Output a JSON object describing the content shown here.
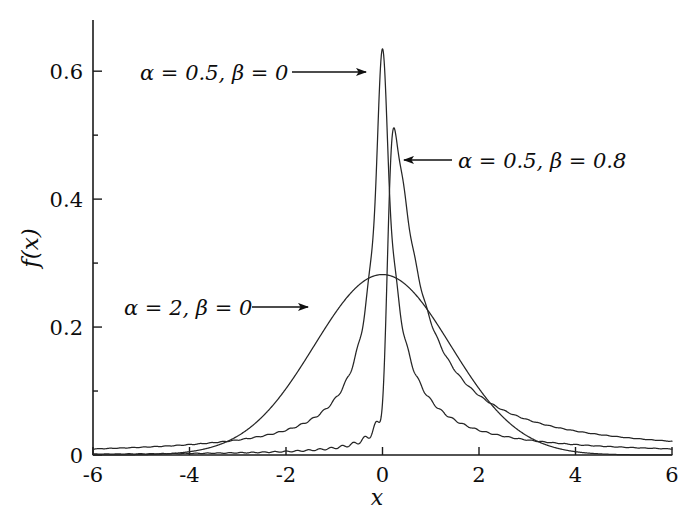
{
  "chart_data": {
    "type": "line",
    "title": "",
    "xlabel": "x",
    "ylabel": "f(x)",
    "xlim": [
      -6,
      6
    ],
    "ylim": [
      0,
      0.68
    ],
    "grid": false,
    "legend_position": "inline-annotations",
    "xticks": [
      -6,
      -4,
      -2,
      0,
      2,
      4,
      6
    ],
    "xtick_labels": [
      "-6",
      "-4",
      "-2",
      "0",
      "2",
      "4",
      "6"
    ],
    "yticks": [
      0,
      0.2,
      0.4,
      0.6
    ],
    "ytick_labels": [
      "0",
      "0.2",
      "0.4",
      "0.6"
    ],
    "ytick_minor": [
      0.1,
      0.3,
      0.5
    ],
    "series": [
      {
        "name": "alpha = 0.5, beta = 0",
        "label": "α = 0.5, β = 0",
        "alpha": 0.5,
        "beta": 0,
        "peak_x": 0.0,
        "peak_y": 0.635,
        "value_at_xmin": 0.012,
        "value_at_xmax": 0.012
      },
      {
        "name": "alpha = 0.5, beta = 0.8",
        "label": "α = 0.5, β = 0.8",
        "alpha": 0.5,
        "beta": 0.8,
        "peak_x": 0.27,
        "peak_y": 0.503,
        "value_at_xmin": 0.003,
        "value_at_xmax": 0.028
      },
      {
        "name": "alpha = 2, beta = 0",
        "label": "α = 2, β = 0",
        "alpha": 2,
        "beta": 0,
        "peak_x": 0.0,
        "peak_y": 0.282,
        "value_at_xmin": 0.0,
        "value_at_xmax": 0.0
      }
    ],
    "annotations": [
      {
        "text": "α = 0.5, β = 0",
        "text_x": 140,
        "text_y": 80,
        "arrow_from_x": 292,
        "arrow_from_y": 72,
        "arrow_to_x": 366,
        "arrow_to_y": 72,
        "direction": "right"
      },
      {
        "text": "α = 0.5, β = 0.8",
        "text_x": 458,
        "text_y": 168,
        "arrow_from_x": 452,
        "arrow_from_y": 160,
        "arrow_to_x": 404,
        "arrow_to_y": 160,
        "direction": "left"
      },
      {
        "text": "α = 2, β = 0",
        "text_x": 124,
        "text_y": 315,
        "arrow_from_x": 252,
        "arrow_from_y": 307,
        "arrow_to_x": 308,
        "arrow_to_y": 307,
        "direction": "right"
      }
    ]
  },
  "plot_geometry": {
    "x_pixel_min": 93,
    "x_pixel_max": 672,
    "y_pixel_zero": 455,
    "y_pixel_top": 20,
    "y_value_at_top": 0.68
  },
  "colors": {
    "background": "#ffffff",
    "axis": "#1a1a1a",
    "curve": "#262626",
    "text": "#0d0d0d"
  }
}
